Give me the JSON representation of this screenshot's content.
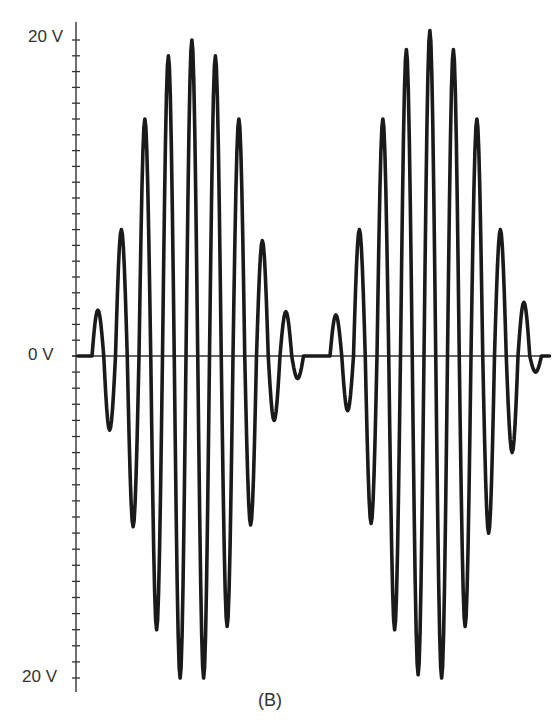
{
  "chart_data": {
    "type": "line",
    "title": "",
    "caption": "(B)",
    "xlabel": "",
    "ylabel": "",
    "y_tick_labels": [
      "20 V",
      "0 V",
      "20 V"
    ],
    "y_tick_values": [
      20,
      0,
      -20
    ],
    "ylim": [
      -20,
      20
    ],
    "y_minor_tick_step": 1,
    "grid": false,
    "legend": null,
    "series": [
      {
        "name": "burst 1 positive peaks (V)",
        "values": [
          2.9,
          8.0,
          15.0,
          19.0,
          20.0,
          19.0,
          15.0,
          7.3,
          2.8
        ]
      },
      {
        "name": "burst 1 negative troughs (V)",
        "values": [
          -4.6,
          -10.6,
          -17.0,
          -20.0,
          -20.0,
          -16.8,
          -10.5,
          -4.0,
          -1.4
        ]
      },
      {
        "name": "burst 2 positive peaks (V)",
        "values": [
          2.6,
          8.0,
          15.0,
          19.4,
          20.6,
          19.4,
          15.0,
          8.0,
          3.4
        ]
      },
      {
        "name": "burst 2 negative troughs (V)",
        "values": [
          -3.4,
          -10.4,
          -17.0,
          -19.8,
          -20.0,
          -16.8,
          -11.0,
          -6.0,
          -1.0
        ]
      }
    ]
  },
  "axis": {
    "label_top": "20 V",
    "label_zero": "0 V",
    "label_bottom": "20 V"
  },
  "figure": {
    "caption": "(B)",
    "line_color": "#1a1a1a",
    "axis_color": "#333333"
  }
}
